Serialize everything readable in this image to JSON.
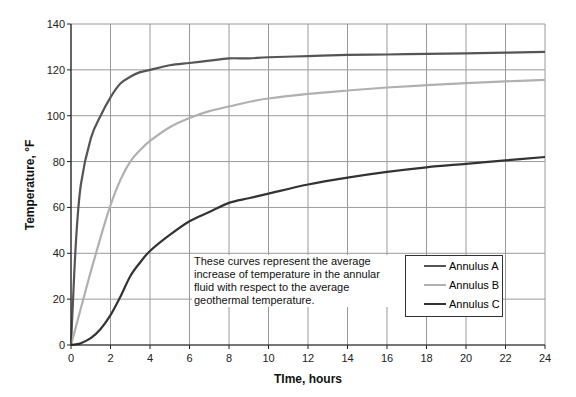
{
  "chart_data": {
    "type": "line",
    "title": "",
    "xlabel": "TIme, hours",
    "ylabel": "Temperature, °F",
    "xlim": [
      0,
      24
    ],
    "ylim": [
      0,
      140
    ],
    "xticks": [
      0,
      2,
      4,
      6,
      8,
      10,
      12,
      14,
      16,
      18,
      20,
      22,
      24
    ],
    "yticks": [
      0,
      20,
      40,
      60,
      80,
      100,
      120,
      140
    ],
    "grid": true,
    "legend_position": "lower right (inside plot)",
    "x": [
      0,
      0.25,
      0.5,
      1,
      1.5,
      2,
      2.5,
      3,
      3.5,
      4,
      5,
      6,
      7,
      8,
      9,
      10,
      12,
      14,
      16,
      18,
      20,
      22,
      24
    ],
    "series": [
      {
        "name": "Annulus A",
        "color": "#555555",
        "values": [
          0,
          45,
          70,
          90,
          100,
          108,
          114,
          117,
          119,
          120,
          122,
          123,
          124,
          125,
          125,
          125.5,
          126,
          126.5,
          126.7,
          127,
          127.2,
          127.5,
          127.8
        ]
      },
      {
        "name": "Annulus B",
        "color": "#b0b0b0",
        "values": [
          0,
          8,
          16,
          32,
          47,
          61,
          72,
          80,
          85,
          89,
          95,
          99,
          102,
          104,
          106,
          107.5,
          109.5,
          111,
          112.3,
          113.3,
          114.2,
          115,
          115.6
        ]
      },
      {
        "name": "Annulus C",
        "color": "#333333",
        "values": [
          0,
          0.3,
          0.8,
          3,
          7,
          13,
          21,
          30,
          36,
          41,
          48,
          54,
          58,
          62,
          64,
          66,
          70,
          73,
          75.5,
          77.5,
          79,
          80.5,
          82
        ]
      }
    ],
    "annotation": "These curves represent the average increase of temperature in the annular fluid with respect to the average geothermal temperature."
  },
  "axes": {
    "xlabel": "TIme, hours",
    "ylabel": "Temperature, °F",
    "xtick_labels": [
      "0",
      "2",
      "4",
      "6",
      "8",
      "10",
      "12",
      "14",
      "16",
      "18",
      "20",
      "22",
      "24"
    ],
    "ytick_labels": [
      "0",
      "20",
      "40",
      "60",
      "80",
      "100",
      "120",
      "140"
    ]
  },
  "annotation": {
    "line1": "These curves represent the average",
    "line2": "increase of temperature in the annular",
    "line3": "fluid with respect to the average",
    "line4": "geothermal temperature."
  },
  "legend": [
    {
      "label": "Annulus A",
      "color": "#555555"
    },
    {
      "label": "Annulus B",
      "color": "#b0b0b0"
    },
    {
      "label": "Annulus C",
      "color": "#333333"
    }
  ]
}
